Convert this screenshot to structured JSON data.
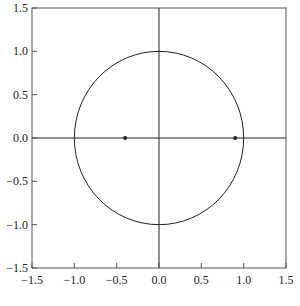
{
  "chart_data": {
    "type": "scatter",
    "title": "",
    "xlabel": "",
    "ylabel": "",
    "xlim": [
      -1.5,
      1.5
    ],
    "ylim": [
      -1.5,
      1.5
    ],
    "grid": false,
    "legend": null,
    "x_ticks": [
      -1.5,
      -1.0,
      -0.5,
      0.0,
      0.5,
      1.0,
      1.5
    ],
    "x_tick_labels": [
      "−1.5",
      "−1.0",
      "−0.5",
      "0.0",
      "0.5",
      "1.0",
      "1.5"
    ],
    "y_ticks": [
      1.5,
      1.0,
      0.5,
      0.0,
      -0.5,
      -1.0,
      -1.5
    ],
    "y_tick_labels": [
      "1.5",
      "1.0",
      "0.5",
      "0.0",
      "−0.5",
      "−1.0",
      "−1.5"
    ],
    "annotations": [
      {
        "kind": "circle",
        "center": [
          0,
          0
        ],
        "radius": 1.0,
        "description": "unit circle"
      },
      {
        "kind": "hline",
        "y": 0.0,
        "description": "real axis"
      },
      {
        "kind": "vline",
        "x": 0.0,
        "description": "imaginary axis"
      }
    ],
    "series": [
      {
        "name": "points",
        "x": [
          -0.4,
          0.9
        ],
        "y": [
          0.0,
          0.0
        ]
      }
    ]
  },
  "colors": {
    "line": "#222222",
    "frame": "#555555",
    "background": "#ffffff"
  }
}
